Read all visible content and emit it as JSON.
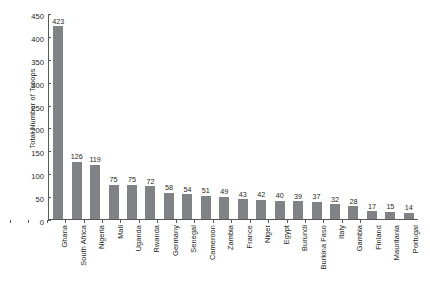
{
  "chart_data": {
    "type": "bar",
    "title": "",
    "xlabel": "",
    "ylabel": "Total Number of Troops",
    "ylim": [
      0,
      450
    ],
    "ytick_step": 50,
    "yticks": [
      0,
      50,
      100,
      150,
      200,
      250,
      300,
      350,
      400,
      450
    ],
    "grid": false,
    "legend": null,
    "bar_color": "#808285",
    "axis_color": "#58595b",
    "text_color": "#231f20",
    "data_labels_shown": true,
    "categories": [
      "Ghana",
      "South Africa",
      "Nigeria",
      "Mali",
      "Uganda",
      "Rwanda",
      "Germany",
      "Senegal",
      "Cameroon",
      "Zambia",
      "France",
      "Niger",
      "Egypt",
      "Burundi",
      "Burkina Faso",
      "Italy",
      "Gambia",
      "Finland",
      "Mauritania",
      "Portugal"
    ],
    "values": [
      423,
      126,
      119,
      75,
      75,
      72,
      58,
      54,
      51,
      49,
      43,
      42,
      40,
      39,
      37,
      32,
      28,
      17,
      15,
      14
    ]
  }
}
